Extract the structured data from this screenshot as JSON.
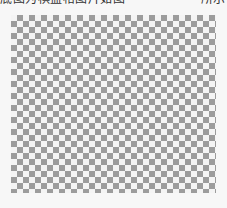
{
  "document": {
    "caption_fragment_left": "底图为棋盘格图片如图",
    "caption_fragment_right": "所示"
  },
  "figure": {
    "type": "checkerboard-pattern",
    "cell_size_px": 6,
    "columns": 34,
    "rows": 30,
    "colors": {
      "dark": "#9c9c9c",
      "light": "#f4f4f4"
    }
  }
}
